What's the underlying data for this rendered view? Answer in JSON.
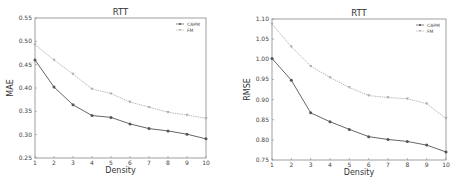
{
  "colors": {
    "capm": "#555555",
    "fm": "#aaaaaa",
    "frame": "#888888"
  },
  "chart_data": [
    {
      "type": "line",
      "title": "RTT",
      "xlabel": "Density",
      "ylabel": "MAE",
      "x": [
        1,
        2,
        3,
        4,
        5,
        6,
        7,
        8,
        9,
        10
      ],
      "xticks": [
        "1",
        "2",
        "3",
        "4",
        "5",
        "6",
        "7",
        "8",
        "9",
        "10"
      ],
      "yticks": [
        "0.25",
        "0.30",
        "0.35",
        "0.40",
        "0.45",
        "0.50",
        "0.55"
      ],
      "ylim": [
        0.25,
        0.55
      ],
      "xlim": [
        1,
        10
      ],
      "legend_position": "upper right",
      "grid": false,
      "series": [
        {
          "name": "CAPM",
          "marker": "circle",
          "values": [
            0.46,
            0.402,
            0.364,
            0.341,
            0.337,
            0.323,
            0.313,
            0.308,
            0.301,
            0.291
          ]
        },
        {
          "name": "FM",
          "marker": "triangle-down",
          "values": [
            0.493,
            0.46,
            0.43,
            0.398,
            0.388,
            0.37,
            0.359,
            0.348,
            0.342,
            0.335
          ]
        }
      ]
    },
    {
      "type": "line",
      "title": "RTT",
      "xlabel": "Density",
      "ylabel": "RMSE",
      "x": [
        1,
        2,
        3,
        4,
        5,
        6,
        7,
        8,
        9,
        10
      ],
      "xticks": [
        "1",
        "2",
        "3",
        "4",
        "5",
        "6",
        "7",
        "8",
        "9",
        "10"
      ],
      "yticks": [
        "0.75",
        "0.80",
        "0.85",
        "0.90",
        "0.95",
        "1.00",
        "1.05",
        "1.10"
      ],
      "ylim": [
        0.75,
        1.1
      ],
      "xlim": [
        1,
        10
      ],
      "legend_position": "upper right",
      "grid": false,
      "series": [
        {
          "name": "CAPM",
          "marker": "circle",
          "values": [
            1.002,
            0.948,
            0.867,
            0.845,
            0.826,
            0.808,
            0.801,
            0.796,
            0.787,
            0.77
          ]
        },
        {
          "name": "FM",
          "marker": "triangle-down",
          "values": [
            1.088,
            1.031,
            0.983,
            0.955,
            0.93,
            0.91,
            0.905,
            0.902,
            0.89,
            0.853
          ]
        }
      ]
    }
  ]
}
